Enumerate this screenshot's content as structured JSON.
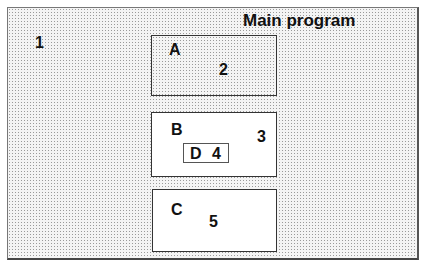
{
  "diagram": {
    "title": "Main program",
    "main_label": "1",
    "boxes": [
      {
        "name": "A",
        "number": "2"
      },
      {
        "name": "B",
        "number": "3",
        "inner": {
          "name": "D",
          "number": "4"
        }
      },
      {
        "name": "C",
        "number": "5"
      }
    ]
  }
}
